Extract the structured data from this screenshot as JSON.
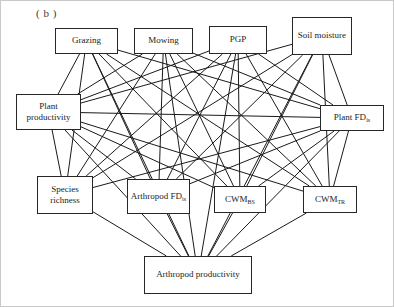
{
  "figure": {
    "panel_label": "( b )",
    "type": "path-diagram"
  },
  "nodes": [
    {
      "id": "grazing",
      "label": "Grazing",
      "row": 1,
      "x": 55,
      "y": 28,
      "w": 63,
      "h": 26
    },
    {
      "id": "mowing",
      "label": "Mowing",
      "row": 1,
      "x": 134,
      "y": 28,
      "w": 59,
      "h": 26
    },
    {
      "id": "pgp",
      "label": "PGP",
      "row": 1,
      "x": 209,
      "y": 26,
      "w": 58,
      "h": 28
    },
    {
      "id": "soil_moisture",
      "label": "Soil moisture",
      "row": 1,
      "x": 292,
      "y": 17,
      "w": 60,
      "h": 38
    },
    {
      "id": "plant_productivity",
      "label": "Plant productivity",
      "row": 2,
      "x": 16,
      "y": 94,
      "w": 65,
      "h": 36
    },
    {
      "id": "plant_fd",
      "label": "Plant FD",
      "sub": "is",
      "row": 2,
      "x": 320,
      "y": 105,
      "w": 64,
      "h": 26
    },
    {
      "id": "species_richness",
      "label": "Species richness",
      "row": 3,
      "x": 37,
      "y": 176,
      "w": 56,
      "h": 38
    },
    {
      "id": "arthropod_fd",
      "label": "Arthropod FD",
      "sub": "is",
      "row": 3,
      "x": 127,
      "y": 179,
      "w": 63,
      "h": 35
    },
    {
      "id": "cwm_bs",
      "label": "CWM",
      "sub": "BS",
      "row": 3,
      "x": 214,
      "y": 186,
      "w": 52,
      "h": 27
    },
    {
      "id": "cwm_tr",
      "label": "CWM",
      "sub": "TR",
      "row": 3,
      "x": 303,
      "y": 186,
      "w": 54,
      "h": 27
    },
    {
      "id": "arthropod_productivity",
      "label": "Arthropod productivity",
      "row": 4,
      "x": 144,
      "y": 256,
      "w": 108,
      "h": 38
    }
  ],
  "edges": [
    {
      "from": "grazing",
      "to": "plant_productivity"
    },
    {
      "from": "grazing",
      "to": "species_richness"
    },
    {
      "from": "grazing",
      "to": "arthropod_fd"
    },
    {
      "from": "grazing",
      "to": "cwm_bs"
    },
    {
      "from": "grazing",
      "to": "cwm_tr"
    },
    {
      "from": "grazing",
      "to": "plant_fd"
    },
    {
      "from": "grazing",
      "to": "arthropod_productivity"
    },
    {
      "from": "mowing",
      "to": "plant_productivity"
    },
    {
      "from": "mowing",
      "to": "species_richness"
    },
    {
      "from": "mowing",
      "to": "arthropod_fd"
    },
    {
      "from": "mowing",
      "to": "cwm_bs"
    },
    {
      "from": "mowing",
      "to": "cwm_tr"
    },
    {
      "from": "mowing",
      "to": "plant_fd"
    },
    {
      "from": "mowing",
      "to": "arthropod_productivity"
    },
    {
      "from": "pgp",
      "to": "plant_productivity"
    },
    {
      "from": "pgp",
      "to": "species_richness"
    },
    {
      "from": "pgp",
      "to": "arthropod_fd"
    },
    {
      "from": "pgp",
      "to": "cwm_bs"
    },
    {
      "from": "pgp",
      "to": "cwm_tr"
    },
    {
      "from": "pgp",
      "to": "plant_fd"
    },
    {
      "from": "pgp",
      "to": "arthropod_productivity"
    },
    {
      "from": "soil_moisture",
      "to": "plant_productivity"
    },
    {
      "from": "soil_moisture",
      "to": "species_richness"
    },
    {
      "from": "soil_moisture",
      "to": "arthropod_fd"
    },
    {
      "from": "soil_moisture",
      "to": "cwm_bs"
    },
    {
      "from": "soil_moisture",
      "to": "cwm_tr"
    },
    {
      "from": "soil_moisture",
      "to": "plant_fd"
    },
    {
      "from": "soil_moisture",
      "to": "arthropod_productivity"
    },
    {
      "from": "plant_productivity",
      "to": "species_richness"
    },
    {
      "from": "plant_productivity",
      "to": "arthropod_fd"
    },
    {
      "from": "plant_productivity",
      "to": "cwm_bs"
    },
    {
      "from": "plant_productivity",
      "to": "cwm_tr"
    },
    {
      "from": "plant_productivity",
      "to": "arthropod_productivity"
    },
    {
      "from": "plant_fd",
      "to": "species_richness"
    },
    {
      "from": "plant_fd",
      "to": "arthropod_fd"
    },
    {
      "from": "plant_fd",
      "to": "cwm_bs"
    },
    {
      "from": "plant_fd",
      "to": "cwm_tr"
    },
    {
      "from": "plant_fd",
      "to": "arthropod_productivity"
    },
    {
      "from": "species_richness",
      "to": "arthropod_productivity"
    },
    {
      "from": "arthropod_fd",
      "to": "arthropod_productivity"
    },
    {
      "from": "cwm_bs",
      "to": "arthropod_productivity"
    },
    {
      "from": "cwm_tr",
      "to": "arthropod_productivity"
    },
    {
      "from": "plant_productivity",
      "to": "plant_fd"
    }
  ],
  "style": {
    "edge_color": "#1a1a1a",
    "node_border": "#262626",
    "node_fill": "#ffffff",
    "frame_color": "#c9c9c9"
  }
}
